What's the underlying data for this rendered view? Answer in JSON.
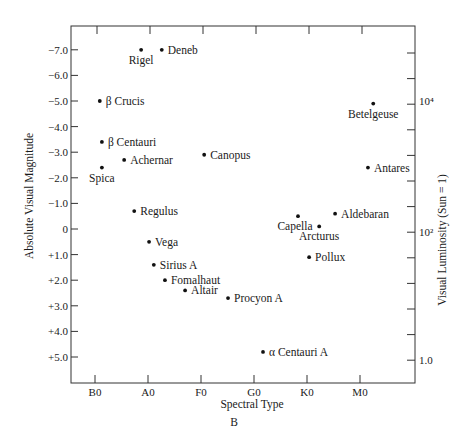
{
  "chart_data": {
    "type": "scatter",
    "title": "",
    "caption": "B",
    "xlabel": "Spectral Type",
    "ylabel": "Absolute Visual Magnitude",
    "ylabel_right": "Visual Luminosity (Sun = 1)",
    "x_categories": [
      "B0",
      "A0",
      "F0",
      "G0",
      "K0",
      "M0"
    ],
    "y_ticks": [
      "-7.0",
      "-6.0",
      "-5.0",
      "-4.0",
      "-3.0",
      "-2.0",
      "-1.0",
      "0",
      "+1.0",
      "+2.0",
      "+3.0",
      "+4.0",
      "+5.0"
    ],
    "y_tick_values": [
      -7,
      -6,
      -5,
      -4,
      -3,
      -2,
      -1,
      0,
      1,
      2,
      3,
      4,
      5
    ],
    "ylim": [
      5.9,
      -7.9
    ],
    "y_inverted": true,
    "right_axis_ticks": [
      {
        "label": "10⁴",
        "magnitude": -5.0
      },
      {
        "label": "10²",
        "magnitude": 0.1
      },
      {
        "label": "1.0",
        "magnitude": 5.1
      }
    ],
    "grid": false,
    "legend": null,
    "points": [
      {
        "name": "Rigel",
        "spectral": "B8",
        "spectral_index": 0.87,
        "magnitude": -7.0,
        "label_pos": "below"
      },
      {
        "name": "Deneb",
        "spectral": "A2",
        "spectral_index": 1.26,
        "magnitude": -7.0,
        "label_pos": "right"
      },
      {
        "name": "β Crucis",
        "spectral": "B1",
        "spectral_index": 0.09,
        "magnitude": -5.0,
        "label_pos": "right"
      },
      {
        "name": "β Centauri",
        "spectral": "B1",
        "spectral_index": 0.13,
        "magnitude": -3.4,
        "label_pos": "right"
      },
      {
        "name": "Achernar",
        "spectral": "B5",
        "spectral_index": 0.55,
        "magnitude": -2.7,
        "label_pos": "right"
      },
      {
        "name": "Spica",
        "spectral": "B1",
        "spectral_index": 0.13,
        "magnitude": -2.4,
        "label_pos": "below"
      },
      {
        "name": "Canopus",
        "spectral": "F0",
        "spectral_index": 2.06,
        "magnitude": -2.9,
        "label_pos": "right"
      },
      {
        "name": "Regulus",
        "spectral": "B7",
        "spectral_index": 0.74,
        "magnitude": -0.7,
        "label_pos": "right"
      },
      {
        "name": "Vega",
        "spectral": "A0",
        "spectral_index": 1.02,
        "magnitude": 0.5,
        "label_pos": "right"
      },
      {
        "name": "Sirius A",
        "spectral": "A1",
        "spectral_index": 1.11,
        "magnitude": 1.4,
        "label_pos": "right"
      },
      {
        "name": "Fomalhaut",
        "spectral": "A3",
        "spectral_index": 1.32,
        "magnitude": 2.0,
        "label_pos": "right"
      },
      {
        "name": "Altair",
        "spectral": "A7",
        "spectral_index": 1.7,
        "magnitude": 2.4,
        "label_pos": "right"
      },
      {
        "name": "Procyon A",
        "spectral": "F5",
        "spectral_index": 2.51,
        "magnitude": 2.7,
        "label_pos": "right"
      },
      {
        "name": "α Centauri A",
        "spectral": "G2",
        "spectral_index": 3.17,
        "magnitude": 4.8,
        "label_pos": "right"
      },
      {
        "name": "Capella",
        "spectral": "G8",
        "spectral_index": 3.83,
        "magnitude": -0.5,
        "label_pos": "below-left"
      },
      {
        "name": "Arcturus",
        "spectral": "K2",
        "spectral_index": 4.23,
        "magnitude": -0.1,
        "label_pos": "below"
      },
      {
        "name": "Aldebaran",
        "spectral": "K5",
        "spectral_index": 4.53,
        "magnitude": -0.6,
        "label_pos": "right"
      },
      {
        "name": "Pollux",
        "spectral": "K0",
        "spectral_index": 4.04,
        "magnitude": 1.1,
        "label_pos": "right"
      },
      {
        "name": "Betelgeuse",
        "spectral": "M2",
        "spectral_index": 5.25,
        "magnitude": -4.9,
        "label_pos": "below"
      },
      {
        "name": "Antares",
        "spectral": "M1",
        "spectral_index": 5.15,
        "magnitude": -2.4,
        "label_pos": "right"
      }
    ]
  }
}
